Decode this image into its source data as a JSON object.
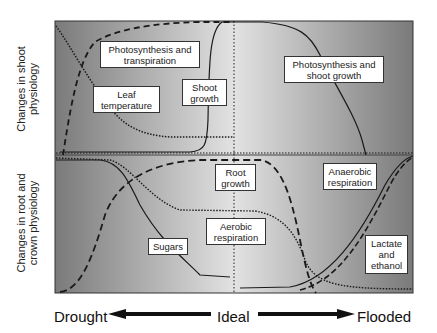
{
  "y_axis_labels": {
    "shoot": "Changes in shoot physiology",
    "shoot_line1": "Changes in shoot",
    "shoot_line2": "physiology",
    "root": "Changes in root and crown physiology",
    "root_line1": "Changes in root and",
    "root_line2": "crown physiology"
  },
  "x_axis": {
    "left": "Drought",
    "center": "Ideal",
    "right": "Flooded"
  },
  "labels": {
    "photo_transp_1": "Photosynthesis and",
    "photo_transp_2": "transpiration",
    "leaf_temp_1": "Leaf",
    "leaf_temp_2": "temperature",
    "shoot_growth_1": "Shoot",
    "shoot_growth_2": "growth",
    "photo_shoot_1": "Photosynthesis and",
    "photo_shoot_2": "shoot growth",
    "root_growth_1": "Root",
    "root_growth_2": "growth",
    "anaerobic_1": "Anaerobic",
    "anaerobic_2": "respiration",
    "sugars": "Sugars",
    "aerobic_1": "Aerobic",
    "aerobic_2": "respiration",
    "lactate_1": "Lactate",
    "lactate_2": "and",
    "lactate_3": "ethanol"
  },
  "colors": {
    "panel_dark": "#7d7d7d",
    "panel_light": "#dedede",
    "line": "#1a1a1a"
  },
  "diagram_data": {
    "panels": [
      "Shoot physiology",
      "Root and crown physiology"
    ],
    "x_gradient": [
      "Drought",
      "Ideal",
      "Flooded"
    ],
    "shoot_curves": [
      {
        "name": "Photosynthesis and transpiration",
        "style": "dashed",
        "trend": "rises steeply from drought to plateau near ideal"
      },
      {
        "name": "Leaf temperature",
        "style": "dotted",
        "trend": "high at drought, falls to low plateau"
      },
      {
        "name": "Shoot growth",
        "style": "solid",
        "trend": "low, rises sharply just before ideal"
      },
      {
        "name": "Photosynthesis and shoot growth",
        "style": "solid",
        "trend": "high at ideal, declines toward flooded"
      }
    ],
    "root_curves": [
      {
        "name": "Sugars",
        "style": "solid",
        "trend": "high at drought, decreasing toward ideal"
      },
      {
        "name": "Root growth",
        "style": "dashed",
        "trend": "rises from drought, peaks at ideal, falls toward flooded"
      },
      {
        "name": "Aerobic respiration",
        "style": "dotted",
        "trend": "high, falls to mid, then falls to low at flooded"
      },
      {
        "name": "Anaerobic respiration",
        "style": "solid",
        "trend": "low, rises toward flooded"
      },
      {
        "name": "Lactate and ethanol",
        "style": "dashed",
        "trend": "low, rises toward flooded"
      }
    ]
  }
}
